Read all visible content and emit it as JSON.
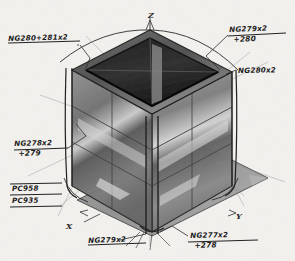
{
  "sheet": {
    "background_color": "#f4f2ef",
    "ink_color": "#1c1c1c",
    "medium": "pencil-sketch"
  },
  "drawing": {
    "subject": "transparent cube enclosure",
    "projection": "isometric",
    "ground_plane_color": "#8d8d8d",
    "body_fill_color": "#6b6b6b",
    "top_recess_color": "#2a2a2a"
  },
  "axes": [
    {
      "label": "Z",
      "direction": "up",
      "x": 148,
      "y": 10
    },
    {
      "label": "Y",
      "direction": "right-down",
      "x": 236,
      "y": 211
    },
    {
      "label": "X",
      "direction": "left-down",
      "x": 66,
      "y": 221
    }
  ],
  "annotations": [
    {
      "id": "anno-top-left",
      "line1": "NG280+281x2",
      "line2": "",
      "x": 8,
      "y": 34
    },
    {
      "id": "anno-top-right",
      "line1": "NG279x2",
      "line2": "+280",
      "x": 229,
      "y": 27
    },
    {
      "id": "anno-right",
      "line1": "NG280x2",
      "line2": "",
      "x": 238,
      "y": 66
    },
    {
      "id": "anno-left",
      "line1": "NG278x2",
      "line2": "+279",
      "x": 14,
      "y": 140
    },
    {
      "id": "anno-pc-958",
      "line1": "PC958",
      "line2": "",
      "x": 12,
      "y": 185
    },
    {
      "id": "anno-pc-935",
      "line1": "PC935",
      "line2": "",
      "x": 12,
      "y": 199
    },
    {
      "id": "anno-bottom-left",
      "line1": "NG279x2",
      "line2": "",
      "x": 88,
      "y": 236
    },
    {
      "id": "anno-bottom-right",
      "line1": "NG277x2",
      "line2": "+278",
      "x": 190,
      "y": 233
    }
  ]
}
